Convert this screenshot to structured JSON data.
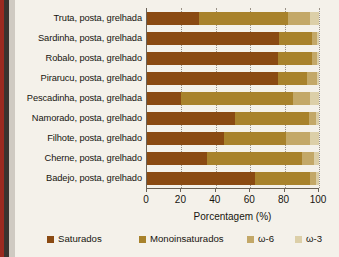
{
  "chart_data": {
    "type": "bar",
    "orientation": "horizontal",
    "stacked": true,
    "title": "",
    "xlabel": "Porcentagem (%)",
    "ylabel": "",
    "xlim": [
      0,
      100
    ],
    "xticks": [
      "0",
      "20",
      "40",
      "60",
      "80",
      "100"
    ],
    "grid": true,
    "legend_position": "bottom",
    "categories": [
      "Truta, posta, grelhada",
      "Sardinha, posta, grelhada",
      "Robalo, posta, grelhado",
      "Pirarucu, posta, grelhado",
      "Pescadinha, posta, grelhada",
      "Namorado, posta, grelhado",
      "Filhote, posta, grelhado",
      "Cherne, posta, grelhado",
      "Badejo, posta, grelhado"
    ],
    "series": [
      {
        "name": "Saturados",
        "color": "#8a4a12",
        "values": [
          30,
          77,
          76,
          76,
          20,
          51,
          45,
          35,
          63
        ]
      },
      {
        "name": "Monoinsaturados",
        "color": "#a8822c",
        "values": [
          52,
          19,
          20,
          17,
          65,
          43,
          36,
          55,
          32
        ]
      },
      {
        "name": "ω-6",
        "color": "#c3a868",
        "values": [
          13,
          3,
          3,
          6,
          10,
          4,
          14,
          7,
          3
        ]
      },
      {
        "name": "ω-3",
        "color": "#dccfa8",
        "values": [
          5,
          1,
          1,
          1,
          5,
          2,
          5,
          3,
          2
        ]
      }
    ]
  },
  "legend": {
    "items": [
      {
        "label": "Saturados",
        "color": "#8a4a12"
      },
      {
        "label": "Monoinsaturados",
        "color": "#a8822c"
      },
      {
        "label": "ω-6",
        "color": "#c3a868"
      },
      {
        "label": "ω-3",
        "color": "#dccfa8"
      }
    ]
  }
}
